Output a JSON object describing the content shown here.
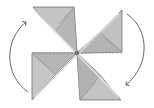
{
  "diagram": {
    "rotation": "clockwise",
    "colors": {
      "paper_light": "#c9c9c9",
      "paper_mid": "#b4b4b4",
      "paper_dark": "#a3a3a3",
      "edge": "#6e6e6e",
      "fold_line": "#8a8a8a",
      "arrow": "#555555",
      "background": "#ffffff"
    },
    "arrows": [
      {
        "name": "left-arrow",
        "direction": "up"
      },
      {
        "name": "right-arrow",
        "direction": "down"
      }
    ]
  }
}
